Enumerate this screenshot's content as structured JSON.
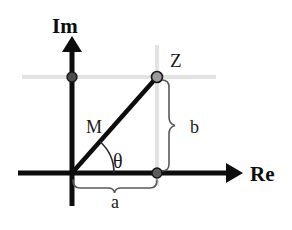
{
  "figure": {
    "background_color": "#ffffff",
    "width": 292,
    "height": 230
  },
  "axes": {
    "imaginary": {
      "label": "Im",
      "icon": "arrow-up-icon",
      "color": "#0d0d0d",
      "x": 72,
      "top_y": 38,
      "bottom_y": 206,
      "label_x": 60,
      "label_y": 30
    },
    "real": {
      "label": "Re",
      "icon": "arrow-right-icon",
      "color": "#0d0d0d",
      "y": 173,
      "left_x": 18,
      "right_x": 241,
      "label_x": 248,
      "label_y": 181
    }
  },
  "guides": {
    "color": "#e0e0e0",
    "horizontal": {
      "y": 77,
      "x1": 22,
      "x2": 216
    },
    "vertical": {
      "x": 157,
      "y1": 45,
      "y2": 186
    }
  },
  "point": {
    "label": "Z",
    "label_x": 170,
    "label_y": 66,
    "x": 157,
    "y": 77,
    "marker_fill": "#8c8c8c",
    "marker_stroke": "#1a1a1a",
    "marker_radius": 5
  },
  "projections": {
    "real_axis_point": {
      "name": "real-projection-point",
      "x": 157,
      "y": 173,
      "marker_fill": "#6b6b6b",
      "marker_stroke": "#1a1a1a",
      "marker_radius": 5
    },
    "imaginary_axis_point": {
      "name": "imaginary-projection-point",
      "x": 72,
      "y": 77,
      "marker_fill": "#4d4d4d",
      "marker_stroke": "#1a1a1a",
      "marker_radius": 5
    }
  },
  "vector": {
    "label": "M",
    "label_x": 92,
    "label_y": 128,
    "color": "#0d0d0d",
    "from_x": 72,
    "from_y": 173,
    "to_x": 157,
    "to_y": 77,
    "stroke_width": 4
  },
  "angle": {
    "label": "θ",
    "label_x": 115,
    "label_y": 165,
    "arc_radius": 42,
    "arc_color": "#1a1a1a",
    "vertex_x": 72,
    "vertex_y": 173,
    "start_degrees": 0,
    "end_degrees": 48.5
  },
  "braces": {
    "horizontal": {
      "label": "a",
      "label_x": 115,
      "label_y": 205,
      "x1": 72,
      "x2": 157,
      "y": 187,
      "color": "#4d4d4d",
      "orientation": "down"
    },
    "vertical": {
      "label": "b",
      "label_x": 192,
      "label_y": 132,
      "y1": 79,
      "y2": 172,
      "x": 168,
      "color": "#4d4d4d",
      "orientation": "right"
    }
  }
}
